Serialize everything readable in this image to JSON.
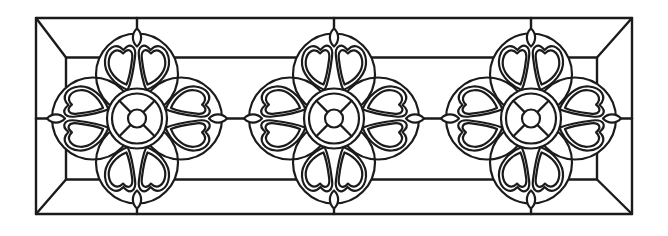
{
  "artwork": {
    "kind": "line-art stained glass / leaded window panel design",
    "description": "Horizontal rectangular transom panel with beveled frame and three identical heart-petal rosette medallions",
    "rosette_count": 3,
    "petals_per_rosette": 8,
    "buds_per_rosette": 4
  },
  "colors": {
    "line": "#1b1b1b",
    "background": "#ffffff"
  },
  "geometry": {
    "canvas": {
      "width": 668,
      "height": 236
    },
    "frame": {
      "outer": {
        "x": 36,
        "y": 18,
        "w": 596,
        "h": 196
      },
      "inner": {
        "x": 66,
        "y": 57.5,
        "w": 531,
        "h": 122
      },
      "stroke_width": 2.4
    },
    "connectors": [
      [
        137,
        18,
        137,
        28.5
      ],
      [
        334,
        18,
        334,
        28.5
      ],
      [
        531,
        18,
        531,
        28.5
      ],
      [
        137,
        208.5,
        137,
        214
      ],
      [
        334,
        208.5,
        334,
        214
      ],
      [
        531,
        208.5,
        531,
        214
      ],
      [
        36,
        118.5,
        47,
        118.5
      ],
      [
        227,
        118.5,
        244,
        118.5
      ],
      [
        424,
        118.5,
        441,
        118.5
      ],
      [
        621,
        118.5,
        632,
        118.5
      ]
    ],
    "rosette": {
      "centers_x": [
        137,
        334,
        531
      ],
      "center_y": 118.5,
      "stroke_width": 2.2,
      "petal_circle": {
        "distance": 44,
        "radius": 41
      },
      "ring": {
        "outer_radius": 30,
        "inner_radius": 25
      },
      "hub_radius": 9,
      "spoke_angles_deg": [
        45,
        135,
        225,
        315
      ],
      "bud": {
        "tip_outer": 90,
        "tip_inner": 72,
        "half_width": 5.5
      },
      "heart": {
        "start": [
          -9.3,
          -28.6
        ],
        "curves": [
          [
            [
              -23,
              -34
            ],
            [
              -33,
              -46
            ],
            [
              -32,
              -58
            ]
          ],
          [
            [
              -31,
              -70
            ],
            [
              -21.5,
              -77
            ],
            [
              -13.5,
              -68.5
            ]
          ],
          [
            [
              -7,
              -76.5
            ],
            [
              -0.5,
              -72.5
            ],
            [
              -2,
              -61.5
            ]
          ],
          [
            [
              -3.5,
              -49
            ],
            [
              -5.5,
              -37
            ],
            [
              -9.3,
              -28.6
            ]
          ]
        ],
        "inner_scale": 0.78,
        "inner_scale_center": [
          -15,
          -53
        ]
      }
    }
  }
}
